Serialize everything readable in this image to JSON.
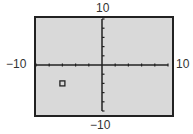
{
  "chart_data": {
    "type": "scatter",
    "title": "",
    "xlabel": "",
    "ylabel": "",
    "xlim": [
      -10,
      10
    ],
    "ylim": [
      -10,
      10
    ],
    "x_tick_step": 2,
    "y_tick_step": 2,
    "grid": false,
    "points": [
      {
        "x": -6,
        "y": -4,
        "marker": "square"
      }
    ],
    "tick_labels": {
      "x_min": "−10",
      "x_max": "10",
      "y_min": "−10",
      "y_max": "10"
    }
  },
  "colors": {
    "plot_background": "#d9d9d9",
    "axis": "#222222",
    "frame": "#222222",
    "text": "#333333"
  }
}
